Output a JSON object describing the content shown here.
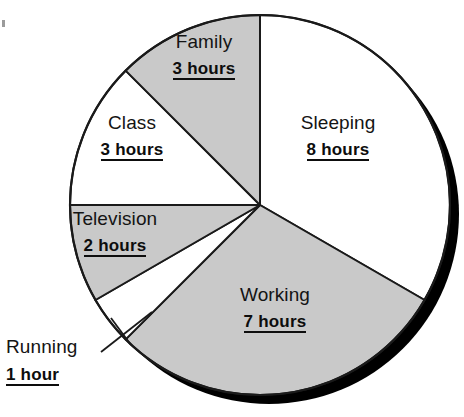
{
  "chart_data": {
    "type": "pie",
    "title": "",
    "subtitle": "",
    "xlabel": "",
    "ylabel": "",
    "unit": "hours",
    "total": 24,
    "categories": [
      "Sleeping",
      "Working",
      "Running",
      "Television",
      "Class",
      "Family"
    ],
    "values": [
      8,
      7,
      1,
      2,
      3,
      3
    ],
    "value_labels": [
      "8 hours",
      "7 hours",
      "1 hour",
      "2 hours",
      "3 hours",
      "3 hours"
    ],
    "legend_position": "none",
    "grid": false,
    "start_angle_deg": 0,
    "direction": "clockwise",
    "slices": [
      {
        "label": "Sleeping",
        "value": 8,
        "value_label": "8 hours",
        "angle_deg": 120,
        "fill": "#ffffff",
        "label_placement": "inside"
      },
      {
        "label": "Working",
        "value": 7,
        "value_label": "7 hours",
        "angle_deg": 105,
        "fill": "#c9c9c9",
        "label_placement": "inside"
      },
      {
        "label": "Running",
        "value": 1,
        "value_label": "1 hour",
        "angle_deg": 15,
        "fill": "#ffffff",
        "label_placement": "outside-leader"
      },
      {
        "label": "Television",
        "value": 2,
        "value_label": "2 hours",
        "angle_deg": 30,
        "fill": "#c9c9c9",
        "label_placement": "inside"
      },
      {
        "label": "Class",
        "value": 3,
        "value_label": "3 hours",
        "angle_deg": 45,
        "fill": "#ffffff",
        "label_placement": "inside"
      },
      {
        "label": "Family",
        "value": 3,
        "value_label": "3 hours",
        "angle_deg": 45,
        "fill": "#c9c9c9",
        "label_placement": "inside"
      }
    ]
  },
  "colors": {
    "background": "#ffffff",
    "slice_gray": "#c9c9c9",
    "slice_white": "#ffffff",
    "outline": "#1a1a1a",
    "shadow": "#000000",
    "text": "#111111"
  },
  "geometry": {
    "center_x": 260,
    "center_y": 205,
    "radius": 190,
    "shadow_offset_x": 9,
    "shadow_offset_y": 9
  }
}
